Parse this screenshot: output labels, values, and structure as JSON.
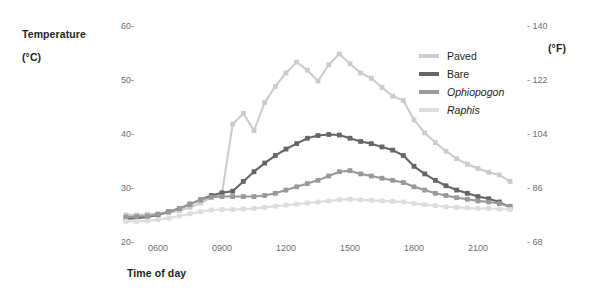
{
  "chart_data": {
    "type": "line",
    "title": "",
    "subtitle": "",
    "xlabel": "Time of day",
    "ylabel": "Temperature (°C)",
    "y2label": "(°F)",
    "ylabel_line1": "Temperature",
    "ylabel_line2": "(°C)",
    "grid": false,
    "legend_position": "right-top",
    "xlim": [
      4.0,
      23.5
    ],
    "ylim": [
      20,
      60
    ],
    "y2lim": [
      68,
      140
    ],
    "xticks": [
      6,
      9,
      12,
      15,
      18,
      21
    ],
    "xticklabels": [
      "0600",
      "0900",
      "1200",
      "1500",
      "1800",
      "2100"
    ],
    "yticks": [
      20,
      30,
      40,
      50,
      60
    ],
    "yticklabels": [
      "20-",
      "30-",
      "40-",
      "50-",
      "60-"
    ],
    "y2ticks": [
      68,
      86,
      104,
      122,
      140
    ],
    "y2ticklabels": [
      "- 68",
      "- 86",
      "- 104",
      "- 122",
      "- 140"
    ],
    "x": [
      4.5,
      5.0,
      5.5,
      6.0,
      6.5,
      7.0,
      7.5,
      8.0,
      8.5,
      9.0,
      9.5,
      10.0,
      10.5,
      11.0,
      11.5,
      12.0,
      12.5,
      13.0,
      13.5,
      14.0,
      14.5,
      15.0,
      15.5,
      16.0,
      16.5,
      17.0,
      17.5,
      18.0,
      18.5,
      19.0,
      19.5,
      20.0,
      20.5,
      21.0,
      21.5,
      22.0,
      22.5
    ],
    "series": [
      {
        "name": "Paved",
        "color": "#cccccc",
        "values": [
          25.2,
          25.2,
          25.3,
          25.4,
          25.6,
          26.0,
          26.6,
          27.4,
          28.4,
          29.2,
          42.0,
          44.0,
          40.8,
          46.0,
          49.0,
          51.5,
          53.5,
          52.0,
          50.0,
          53.0,
          55.0,
          53.2,
          51.5,
          50.5,
          48.8,
          47.2,
          46.4,
          42.8,
          40.4,
          38.6,
          37.0,
          35.6,
          34.6,
          33.8,
          33.1,
          32.6,
          31.4
        ]
      },
      {
        "name": "Bare",
        "color": "#666666",
        "values": [
          24.5,
          24.6,
          24.8,
          25.2,
          25.8,
          26.4,
          27.2,
          28.0,
          28.8,
          29.3,
          29.6,
          31.4,
          33.2,
          34.8,
          36.2,
          37.4,
          38.4,
          39.4,
          39.9,
          40.1,
          40.0,
          39.4,
          38.8,
          38.4,
          37.8,
          37.2,
          36.2,
          34.2,
          32.8,
          31.6,
          30.6,
          29.8,
          29.2,
          28.6,
          28.2,
          27.6,
          26.6
        ]
      },
      {
        "name": "Ophiopogon",
        "color": "#999999",
        "values": [
          24.8,
          24.9,
          25.0,
          25.3,
          25.8,
          26.4,
          27.2,
          28.0,
          28.5,
          28.6,
          28.6,
          28.6,
          28.6,
          28.8,
          29.2,
          29.8,
          30.4,
          31.0,
          31.6,
          32.4,
          33.2,
          33.4,
          32.8,
          32.4,
          32.0,
          31.6,
          31.2,
          30.4,
          29.8,
          29.2,
          28.8,
          28.4,
          28.1,
          27.8,
          27.6,
          27.3,
          26.8
        ]
      },
      {
        "name": "Raphis",
        "color": "#dddddd",
        "values": [
          24.0,
          24.0,
          24.1,
          24.3,
          24.6,
          25.0,
          25.4,
          25.8,
          26.1,
          26.2,
          26.2,
          26.3,
          26.4,
          26.6,
          26.8,
          27.0,
          27.2,
          27.4,
          27.6,
          27.8,
          28.0,
          28.1,
          28.0,
          27.9,
          27.8,
          27.7,
          27.6,
          27.3,
          27.1,
          26.9,
          26.7,
          26.6,
          26.5,
          26.4,
          26.4,
          26.3,
          26.2
        ]
      }
    ]
  },
  "legend": {
    "items": [
      {
        "label": "Paved",
        "color": "#cccccc",
        "italic": false
      },
      {
        "label": "Bare",
        "color": "#666666",
        "italic": false
      },
      {
        "label": "Ophiopogon",
        "color": "#999999",
        "italic": true
      },
      {
        "label": "Raphis",
        "color": "#dddddd",
        "italic": true
      }
    ]
  }
}
